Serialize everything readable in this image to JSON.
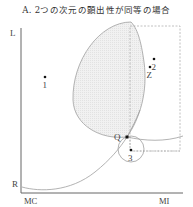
{
  "title": "A. 2つの次元の顕出性が同等の場合",
  "axes": {
    "y_top_label": "L",
    "y_bottom_label": "R",
    "x_left_label": "MC",
    "x_right_label": "MI"
  },
  "points": [
    {
      "id": "1",
      "label": "1",
      "x": 45,
      "y": 77
    },
    {
      "id": "2",
      "label": "2",
      "x": 154,
      "y": 59
    },
    {
      "id": "Z",
      "label": "Z",
      "x": 150,
      "y": 67
    },
    {
      "id": "Q",
      "label": "Q",
      "x": 127,
      "y": 137
    },
    {
      "id": "3",
      "label": "3",
      "x": 131,
      "y": 150
    }
  ],
  "colors": {
    "axis": "#666666",
    "curve": "#999999",
    "shade": "#eeeeee",
    "dashed": "#aaaaaa",
    "point": "#111111"
  }
}
